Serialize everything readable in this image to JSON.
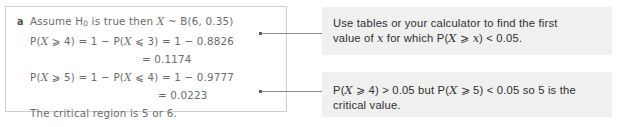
{
  "solution": {
    "part_label": "a",
    "lines": [
      {
        "id": "assumption",
        "indent": "",
        "segments": [
          {
            "t": "Assume H",
            "k": "plain"
          },
          {
            "t": "0",
            "k": "sub"
          },
          {
            "t": " is true then ",
            "k": "plain"
          },
          {
            "t": "X",
            "k": "var"
          },
          {
            "t": " ~ B(6, 0.35)",
            "k": "plain"
          }
        ],
        "text": "Assume H0 is true then X ~ B(6, 0.35)"
      },
      {
        "id": "prob-ge-4",
        "indent": "",
        "segments": [
          {
            "t": "P(",
            "k": "plain"
          },
          {
            "t": "X",
            "k": "var"
          },
          {
            "t": " ⩾ 4) = 1 − P(",
            "k": "plain"
          },
          {
            "t": "X",
            "k": "var"
          },
          {
            "t": " ⩽ 3) = 1 − 0.8826",
            "k": "plain"
          }
        ],
        "text": "P(X ⩾ 4) = 1 − P(X ⩽ 3) = 1 − 0.8826"
      },
      {
        "id": "result-1174",
        "indent": "a",
        "segments": [
          {
            "t": "= 0.1174",
            "k": "plain"
          }
        ],
        "text": "= 0.1174"
      },
      {
        "id": "prob-ge-5",
        "indent": "",
        "segments": [
          {
            "t": "P(",
            "k": "plain"
          },
          {
            "t": "X",
            "k": "var"
          },
          {
            "t": " ⩾ 5) = 1 − P(",
            "k": "plain"
          },
          {
            "t": "X",
            "k": "var"
          },
          {
            "t": " ⩽ 4) = 1 − 0.9777",
            "k": "plain"
          }
        ],
        "text": "P(X ⩾ 5) = 1 − P(X ⩽ 4) = 1 − 0.9777"
      },
      {
        "id": "result-0223",
        "indent": "b",
        "segments": [
          {
            "t": "= 0.0223",
            "k": "plain"
          }
        ],
        "text": "= 0.0223"
      },
      {
        "id": "conclusion",
        "indent": "",
        "segments": [
          {
            "t": "The critical region is 5 or 6.",
            "k": "plain"
          }
        ],
        "text": "The critical region is 5 or 6."
      }
    ]
  },
  "notes": [
    {
      "id": "note-tables-hint",
      "lines": [
        {
          "segments": [
            {
              "t": "Use tables or your calculator to find the first",
              "k": "plain"
            }
          ],
          "text": "Use tables or your calculator to find the first"
        },
        {
          "segments": [
            {
              "t": "value of ",
              "k": "plain"
            },
            {
              "t": "x",
              "k": "var"
            },
            {
              "t": " for which P(",
              "k": "plain"
            },
            {
              "t": "X",
              "k": "var"
            },
            {
              "t": " ⩾ ",
              "k": "rel"
            },
            {
              "t": "x",
              "k": "var"
            },
            {
              "t": ") < 0.05.",
              "k": "plain"
            }
          ],
          "text": "value of x for which P(X ⩾ x) < 0.05."
        }
      ]
    },
    {
      "id": "note-critical-value",
      "lines": [
        {
          "segments": [
            {
              "t": "P(",
              "k": "plain"
            },
            {
              "t": "X",
              "k": "var"
            },
            {
              "t": " ⩾ 4) > 0.05 but P(",
              "k": "plain"
            },
            {
              "t": "X",
              "k": "var"
            },
            {
              "t": " ⩾ 5) < 0.05 so 5 is the",
              "k": "plain"
            }
          ],
          "text": "P(X ⩾ 4) > 0.05 but P(X ⩾ 5) < 0.05 so 5 is the"
        },
        {
          "segments": [
            {
              "t": "critical value.",
              "k": "plain"
            }
          ],
          "text": "critical value."
        }
      ]
    }
  ],
  "connectors": [
    {
      "id": "connector-upper",
      "points_to": "note-tables-hint"
    },
    {
      "id": "connector-lower",
      "points_to": "note-critical-value"
    }
  ],
  "colors": {
    "page_background": "#ffffff",
    "solution_border": "#cfcfcf",
    "solution_text": "#6b6b6b",
    "note_background": "#f0f0ef",
    "note_text": "#2f2f2f",
    "connector_line": "#8c8c8c"
  }
}
